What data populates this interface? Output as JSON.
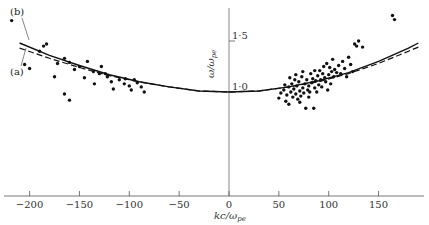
{
  "chart_data": {
    "type": "scatter",
    "title": "",
    "xlabel": "kc/ω_pe",
    "ylabel": "ω/ω_pe",
    "xlim": [
      -215,
      195
    ],
    "ylim": [
      0.8,
      1.8
    ],
    "grid": false,
    "legend": "none (curves annotated (a) and (b) at upper left)",
    "x_ticks": [
      -200,
      -150,
      -100,
      -50,
      0,
      50,
      100,
      150
    ],
    "x_tick_labels": [
      "−200",
      "−150",
      "−100",
      "−50",
      "0",
      "50",
      "100",
      "150"
    ],
    "y_ticks": [
      1.0,
      1.5
    ],
    "y_tick_labels": [
      "1·0",
      "1·5"
    ],
    "annotations": [
      "(b)",
      "(a)"
    ],
    "series": [
      {
        "name": "(a)",
        "style": "dashed",
        "x": [
          -210,
          -180,
          -150,
          -120,
          -90,
          -60,
          -30,
          0,
          30,
          60,
          90,
          120,
          150,
          180,
          190
        ],
        "y": [
          1.43,
          1.33,
          1.24,
          1.16,
          1.1,
          1.05,
          1.01,
          1.0,
          1.01,
          1.05,
          1.1,
          1.18,
          1.28,
          1.4,
          1.44
        ]
      },
      {
        "name": "(b)",
        "style": "solid",
        "x": [
          -210,
          -180,
          -150,
          -120,
          -90,
          -60,
          -30,
          0,
          30,
          60,
          90,
          120,
          150,
          180,
          190
        ],
        "y": [
          1.48,
          1.36,
          1.26,
          1.17,
          1.1,
          1.05,
          1.01,
          1.0,
          1.01,
          1.05,
          1.11,
          1.19,
          1.3,
          1.43,
          1.48
        ]
      },
      {
        "name": "measurements",
        "style": "points",
        "points": [
          [
            -218,
            1.7
          ],
          [
            -190,
            1.4
          ],
          [
            -186,
            1.45
          ],
          [
            -183,
            1.47
          ],
          [
            -205,
            1.27
          ],
          [
            -200,
            1.23
          ],
          [
            -175,
            1.15
          ],
          [
            -172,
            1.28
          ],
          [
            -165,
            1.33
          ],
          [
            -160,
            1.29
          ],
          [
            -155,
            1.22
          ],
          [
            -150,
            1.25
          ],
          [
            -142,
            1.3
          ],
          [
            -136,
            1.2
          ],
          [
            -130,
            1.18
          ],
          [
            -128,
            1.25
          ],
          [
            -122,
            1.15
          ],
          [
            -118,
            1.1
          ],
          [
            -116,
            1.03
          ],
          [
            -110,
            1.12
          ],
          [
            -105,
            1.08
          ],
          [
            -100,
            1.06
          ],
          [
            -95,
            1.12
          ],
          [
            -92,
            1.09
          ],
          [
            -88,
            1.05
          ],
          [
            -85,
            1.0
          ],
          [
            -145,
            1.14
          ],
          [
            -165,
            0.98
          ],
          [
            -160,
            0.92
          ],
          [
            -135,
            1.08
          ],
          [
            -124,
            1.18
          ],
          [
            -104,
            1.13
          ],
          [
            -98,
            1.02
          ],
          [
            50,
            0.94
          ],
          [
            52,
            0.99
          ],
          [
            55,
            1.02
          ],
          [
            57,
            0.91
          ],
          [
            58,
            0.97
          ],
          [
            60,
            1.05
          ],
          [
            60,
            0.88
          ],
          [
            62,
            1.0
          ],
          [
            63,
            1.08
          ],
          [
            64,
            0.95
          ],
          [
            65,
            1.03
          ],
          [
            66,
            1.12
          ],
          [
            67,
            0.98
          ],
          [
            68,
            1.06
          ],
          [
            69,
            0.93
          ],
          [
            70,
            1.1
          ],
          [
            71,
            1.01
          ],
          [
            72,
            0.96
          ],
          [
            73,
            1.15
          ],
          [
            74,
            1.04
          ],
          [
            75,
            0.99
          ],
          [
            76,
            1.08
          ],
          [
            77,
            0.84
          ],
          [
            78,
            1.12
          ],
          [
            79,
            1.02
          ],
          [
            80,
            1.06
          ],
          [
            80,
            0.95
          ],
          [
            82,
            1.18
          ],
          [
            83,
            1.09
          ],
          [
            84,
            1.13
          ],
          [
            85,
            0.84
          ],
          [
            86,
            1.04
          ],
          [
            87,
            1.11
          ],
          [
            88,
            1.0
          ],
          [
            89,
            1.16
          ],
          [
            90,
            1.07
          ],
          [
            91,
            1.21
          ],
          [
            92,
            1.12
          ],
          [
            93,
            1.05
          ],
          [
            94,
            1.18
          ],
          [
            95,
            1.25
          ],
          [
            96,
            1.14
          ],
          [
            97,
            1.1
          ],
          [
            98,
            1.28
          ],
          [
            99,
            1.02
          ],
          [
            100,
            1.17
          ],
          [
            101,
            1.24
          ],
          [
            102,
            1.08
          ],
          [
            103,
            1.2
          ],
          [
            104,
            1.32
          ],
          [
            105,
            1.15
          ],
          [
            106,
            1.22
          ],
          [
            108,
            1.19
          ],
          [
            110,
            1.26
          ],
          [
            112,
            1.18
          ],
          [
            114,
            1.3
          ],
          [
            116,
            1.23
          ],
          [
            118,
            1.15
          ],
          [
            120,
            1.34
          ],
          [
            122,
            1.27
          ],
          [
            124,
            1.2
          ],
          [
            126,
            1.47
          ],
          [
            128,
            1.45
          ],
          [
            130,
            1.5
          ],
          [
            134,
            1.44
          ],
          [
            164,
            1.75
          ],
          [
            166,
            1.71
          ],
          [
            56,
            1.07
          ],
          [
            61,
            1.14
          ],
          [
            67,
            1.17
          ],
          [
            71,
            0.9
          ],
          [
            74,
            1.2
          ],
          [
            81,
            1.0
          ],
          [
            86,
            1.21
          ]
        ]
      }
    ]
  },
  "axes": {
    "x_title_main": "kc",
    "x_title_sep": "/",
    "x_title_omega": "ω",
    "x_title_sub": "pe",
    "y_title": "ω/ω",
    "y_title_sub": "pe"
  },
  "labels": {
    "curve_b": "(b)",
    "curve_a": "(a)"
  }
}
